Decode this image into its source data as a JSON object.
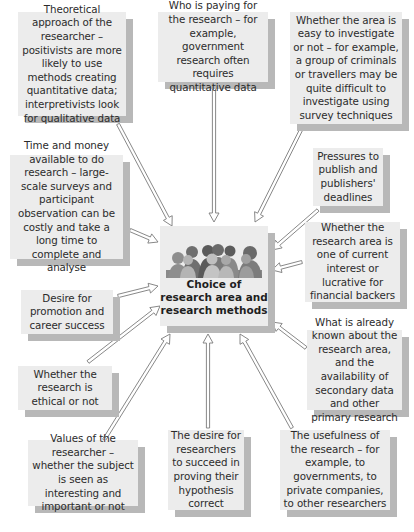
{
  "center": {
    "title": "Choice of research area and research methods",
    "icon": "people-crowd-icon"
  },
  "factors": [
    {
      "id": "theoretical-approach",
      "text": "Theoretical approach of the researcher – positivists are more likely to use methods creating quantitative data; interpretivists look for qualitative data"
    },
    {
      "id": "who-is-paying",
      "text": "Who is paying for the research – for example, government research often requires quantitative data"
    },
    {
      "id": "ease-of-investigation",
      "text": "Whether the area is easy to investigate or not – for example, a group of criminals or travellers may be quite difficult to investigate using survey techniques"
    },
    {
      "id": "time-and-money",
      "text": "Time and money available to do research – large-scale surveys and participant observation can be costly and take a long time to complete and analyse"
    },
    {
      "id": "publishing-pressures",
      "text": "Pressures to publish and publishers' deadlines"
    },
    {
      "id": "current-interest",
      "text": "Whether the research area is one of current interest or lucrative for financial backers"
    },
    {
      "id": "career-success",
      "text": "Desire for promotion and career success"
    },
    {
      "id": "ethical",
      "text": "Whether the research is ethical or not"
    },
    {
      "id": "already-known",
      "text": "What is already known about the research area, and the availability of secondary data and other primary research"
    },
    {
      "id": "values",
      "text": "Values of the researcher – whether the subject is seen as interesting and important or not"
    },
    {
      "id": "prove-hypothesis",
      "text": "The desire for researchers to succeed in proving their hypothesis correct"
    },
    {
      "id": "usefulness",
      "text": "The usefulness of the research – for example, to governments, to private companies, to other researchers"
    }
  ],
  "colors": {
    "box_fill": "#ececec",
    "box_shadow": "#b8b8b8",
    "text": "#2b2b2b",
    "arrow_stroke": "#7a7a7a"
  }
}
